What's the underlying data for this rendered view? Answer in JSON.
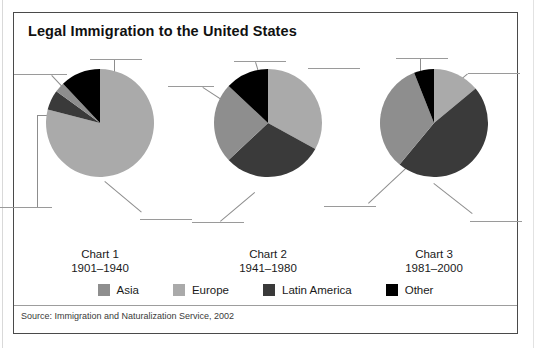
{
  "title": "Legal Immigration to the United States",
  "source": "Source: Immigration and Naturalization Service, 2002",
  "legend": {
    "items": [
      {
        "label": "Asia",
        "color": "#8e8e8e"
      },
      {
        "label": "Europe",
        "color": "#aaaaaa"
      },
      {
        "label": "Latin America",
        "color": "#3a3a3a"
      },
      {
        "label": "Other",
        "color": "#000000"
      }
    ]
  },
  "charts": [
    {
      "name": "Chart 1",
      "period": "1901–1940"
    },
    {
      "name": "Chart 2",
      "period": "1941–1980"
    },
    {
      "name": "Chart 3",
      "period": "1981–2000"
    }
  ],
  "chart_data": [
    {
      "type": "pie",
      "title": "Chart 1",
      "subtitle": "1901–1940",
      "categories": [
        "Europe",
        "Latin America",
        "Asia",
        "Other"
      ],
      "values": [
        79,
        6,
        3,
        12
      ],
      "colors": [
        "#aaaaaa",
        "#3a3a3a",
        "#8e8e8e",
        "#000000"
      ],
      "start_angle_deg": 0,
      "direction": "clockwise",
      "legend": "bottom",
      "labels_shown": false
    },
    {
      "type": "pie",
      "title": "Chart 2",
      "subtitle": "1941–1980",
      "categories": [
        "Europe",
        "Latin America",
        "Asia",
        "Other"
      ],
      "values": [
        33,
        30,
        24,
        13
      ],
      "colors": [
        "#aaaaaa",
        "#3a3a3a",
        "#8e8e8e",
        "#000000"
      ],
      "start_angle_deg": 0,
      "direction": "clockwise",
      "legend": "bottom",
      "labels_shown": false
    },
    {
      "type": "pie",
      "title": "Chart 3",
      "subtitle": "1981–2000",
      "categories": [
        "Europe",
        "Latin America",
        "Asia",
        "Other"
      ],
      "values": [
        14,
        47,
        33,
        6
      ],
      "colors": [
        "#aaaaaa",
        "#3a3a3a",
        "#8e8e8e",
        "#000000"
      ],
      "start_angle_deg": 0,
      "direction": "clockwise",
      "legend": "bottom",
      "labels_shown": false
    }
  ]
}
